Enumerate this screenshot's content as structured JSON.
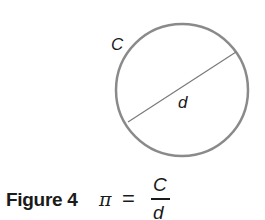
{
  "diagram": {
    "shape": "circle",
    "circle": {
      "cx": 182,
      "cy": 90,
      "r": 66,
      "stroke": "#8a8a8a",
      "stroke_width": 2.5
    },
    "diameter": {
      "x1": 128,
      "y1": 122,
      "x2": 236,
      "y2": 52,
      "stroke": "#7a7a7a",
      "stroke_width": 1.2
    },
    "labels": {
      "circumference": "C",
      "diameter": "d"
    }
  },
  "caption": {
    "figure_label": "Figure 4",
    "formula": {
      "lhs": "π",
      "equals": "=",
      "numerator": "C",
      "denominator": "d"
    }
  }
}
